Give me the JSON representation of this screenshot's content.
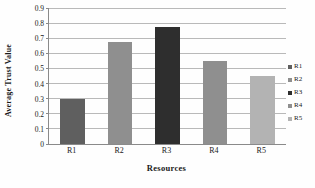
{
  "chart_data": {
    "type": "bar",
    "title": "",
    "categories": [
      "R1",
      "R2",
      "R3",
      "R4",
      "R5"
    ],
    "values": [
      0.3,
      0.675,
      0.775,
      0.55,
      0.45
    ],
    "series": [
      {
        "name": "Average Trust Value",
        "values": [
          0.3,
          0.675,
          0.775,
          0.55,
          0.45
        ]
      }
    ],
    "xlabel": "Resources",
    "ylabel": "Average Trust Value",
    "ylim": [
      0,
      0.9
    ],
    "ytick_labels": [
      "0",
      "0.1",
      "0.2",
      "0.3",
      "0.4",
      "0.5",
      "0.6",
      "0.7",
      "0.8",
      "0.9"
    ],
    "ytick_values": [
      0,
      0.1,
      0.2,
      0.3,
      0.4,
      0.5,
      0.6,
      0.7,
      0.8,
      0.9
    ],
    "grid": true,
    "grid_axis": "y",
    "legend_position": "right",
    "legend": [
      {
        "label": "R1",
        "color": "#5f5f5f"
      },
      {
        "label": "R2",
        "color": "#8f8f8f"
      },
      {
        "label": "R3",
        "color": "#2e2e2e"
      },
      {
        "label": "R4",
        "color": "#8f8f8f"
      },
      {
        "label": "R5",
        "color": "#b3b3b3"
      }
    ],
    "bar_colors": [
      "#5f5f5f",
      "#8f8f8f",
      "#2e2e2e",
      "#8f8f8f",
      "#b3b3b3"
    ],
    "colors": {
      "background": "#fefefe",
      "gridline": "#b9b9b9",
      "axis": "#8a8a8a",
      "text": "#1a1a1a"
    }
  }
}
